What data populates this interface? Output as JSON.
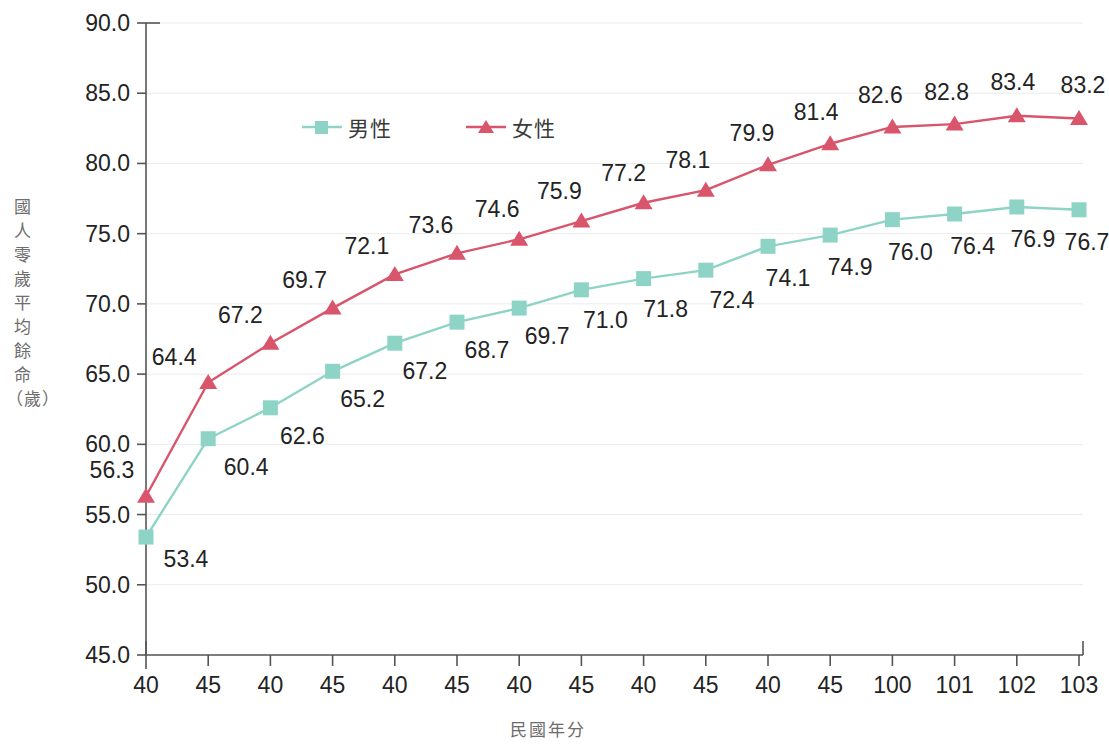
{
  "chart_data": {
    "type": "line",
    "title": "",
    "xlabel": "民國年分",
    "ylabel": "國人零歲平均餘命（歲）",
    "categories": [
      "40",
      "45",
      "40",
      "45",
      "40",
      "45",
      "40",
      "45",
      "40",
      "45",
      "40",
      "45",
      "100",
      "101",
      "102",
      "103"
    ],
    "series": [
      {
        "name": "男性",
        "color": "#8ed4c6",
        "marker": "square",
        "values": [
          53.4,
          60.4,
          62.6,
          65.2,
          67.2,
          68.7,
          69.7,
          71.0,
          71.8,
          72.4,
          74.1,
          74.9,
          76.0,
          76.4,
          76.9,
          76.7
        ],
        "labels": [
          "53.4",
          "60.4",
          "62.6",
          "65.2",
          "67.2",
          "68.7",
          "69.7",
          "71.0",
          "71.8",
          "72.4",
          "74.1",
          "74.9",
          "76.0",
          "76.4",
          "76.9",
          "76.7"
        ]
      },
      {
        "name": "女性",
        "color": "#d8556c",
        "marker": "triangle",
        "values": [
          56.3,
          64.4,
          67.2,
          69.7,
          72.1,
          73.6,
          74.6,
          75.9,
          77.2,
          78.1,
          79.9,
          81.4,
          82.6,
          82.8,
          83.4,
          83.2
        ],
        "labels": [
          "56.3",
          "64.4",
          "67.2",
          "69.7",
          "72.1",
          "73.6",
          "74.6",
          "75.9",
          "77.2",
          "78.1",
          "79.9",
          "81.4",
          "82.6",
          "82.8",
          "83.4",
          "83.2"
        ]
      }
    ],
    "ylim": [
      45.0,
      90.0
    ],
    "yticks": [
      "45.0",
      "50.0",
      "55.0",
      "60.0",
      "65.0",
      "70.0",
      "75.0",
      "80.0",
      "85.0",
      "90.0"
    ],
    "ytick_values": [
      45.0,
      50.0,
      55.0,
      60.0,
      65.0,
      70.0,
      75.0,
      80.0,
      85.0,
      90.0
    ],
    "grid": true,
    "legend_position": "top-center",
    "axis_color": "#555555",
    "grid_color": "#ebebed"
  }
}
